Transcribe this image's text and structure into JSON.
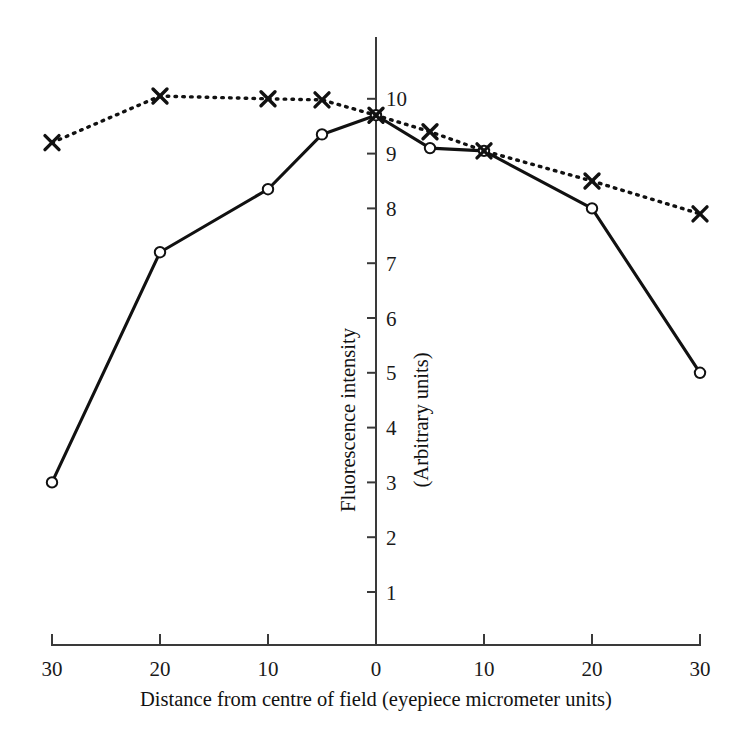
{
  "chart_data": {
    "type": "line",
    "title": "",
    "xlabel": "Distance from centre of field (eyepiece micrometer units)",
    "ylabel": "Fluorescence intensity",
    "ylabel2": "(Arbitrary units)",
    "x": [
      -30,
      -20,
      -10,
      -5,
      0,
      5,
      10,
      20,
      30
    ],
    "xtick_labels": [
      "30",
      "20",
      "10",
      "0",
      "10",
      "20",
      "30"
    ],
    "xtick_values": [
      -30,
      -20,
      -10,
      0,
      10,
      20,
      30
    ],
    "ytick_labels": [
      "1",
      "2",
      "3",
      "4",
      "5",
      "6",
      "7",
      "8",
      "9",
      "10"
    ],
    "ytick_values": [
      1,
      2,
      3,
      4,
      5,
      6,
      7,
      8,
      9,
      10
    ],
    "xlim": [
      -30,
      30
    ],
    "ylim": [
      0,
      10.6
    ],
    "grid": false,
    "legend": "none",
    "series": [
      {
        "name": "solid-circles",
        "marker": "open-circle",
        "linestyle": "solid",
        "color": "#111111",
        "values": [
          3.0,
          7.2,
          8.35,
          9.35,
          9.7,
          9.1,
          9.05,
          8.0,
          5.0
        ]
      },
      {
        "name": "dotted-crosses",
        "marker": "cross",
        "linestyle": "dotted",
        "color": "#111111",
        "values": [
          9.2,
          10.05,
          10.0,
          9.98,
          9.7,
          9.4,
          9.05,
          8.5,
          7.9
        ]
      }
    ]
  }
}
